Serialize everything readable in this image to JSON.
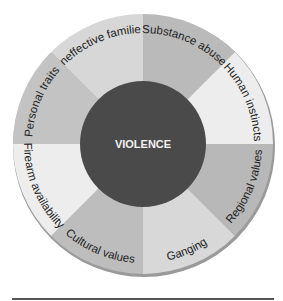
{
  "diagram": {
    "center": {
      "label": "VIOLENCE",
      "color": "#4a4a4a"
    },
    "segments": [
      {
        "label": "Substance abuse",
        "color": "#bababa"
      },
      {
        "label": "Human instincts",
        "color": "#ededed"
      },
      {
        "label": "Regional values",
        "color": "#b8b8b8"
      },
      {
        "label": "Ganging",
        "color": "#d8d8d8"
      },
      {
        "label": "Cultural values",
        "color": "#bdbdbd"
      },
      {
        "label": "Firearm availability",
        "color": "#ededed"
      },
      {
        "label": "Personal traits",
        "color": "#c3c3c3"
      },
      {
        "label": "Ineffective families",
        "color": "#d7d7d7"
      }
    ]
  }
}
